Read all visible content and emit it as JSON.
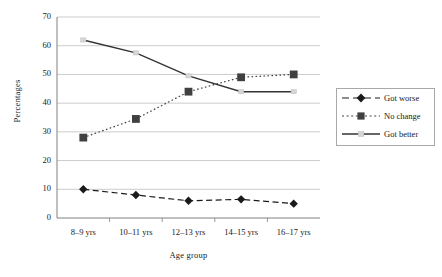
{
  "chart_data": {
    "type": "line",
    "title": "",
    "xlabel": "Age group",
    "ylabel": "Percentages",
    "categories": [
      "8–9 yrs",
      "10–11 yrs",
      "12–13 yrs",
      "14–15 yrs",
      "16–17 yrs"
    ],
    "ylim": [
      0,
      70
    ],
    "yticks": [
      0,
      10,
      20,
      30,
      40,
      50,
      60,
      70
    ],
    "ytick_labels": [
      "0",
      "10",
      "20",
      "30",
      "40",
      "50",
      "60",
      "70"
    ],
    "grid": true,
    "grid_axis": "y",
    "legend_position": "right",
    "series": [
      {
        "name": "Got worse",
        "marker": "diamond",
        "line_style": "dashed",
        "color": "#1a1a1a",
        "values": [
          10,
          8,
          6,
          6.5,
          5
        ]
      },
      {
        "name": "No change",
        "marker": "square",
        "line_style": "dotted",
        "color": "#404040",
        "values": [
          28,
          34.5,
          44,
          49,
          50
        ]
      },
      {
        "name": "Got better",
        "marker": "line",
        "line_style": "solid",
        "color": "#333333",
        "values": [
          62,
          57.5,
          49.5,
          44,
          44
        ]
      }
    ]
  },
  "legend": {
    "entries": [
      {
        "label": "Got worse"
      },
      {
        "label": "No change"
      },
      {
        "label": "Got better"
      }
    ]
  },
  "colors": {
    "axis": "#808080",
    "grid": "#bfbfbf",
    "series_got_worse": "#1a1a1a",
    "series_no_change": "#404040",
    "series_got_better": "#333333",
    "legend_border": "#a9a9a9",
    "background": "#ffffff"
  }
}
